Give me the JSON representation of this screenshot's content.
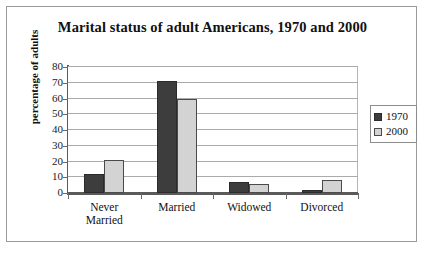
{
  "chart_data": {
    "type": "bar",
    "title": "Marital status of adult Americans, 1970 and 2000",
    "xlabel": "",
    "ylabel": "percentage of adults",
    "categories": [
      "Never\nMarried",
      "Married",
      "Widowed",
      "Divorced"
    ],
    "series": [
      {
        "name": "1970",
        "values": [
          12,
          71,
          7,
          2
        ],
        "color": "#3d3d3d"
      },
      {
        "name": "2000",
        "values": [
          21,
          60,
          6,
          8
        ],
        "color": "#d3d3d3"
      }
    ],
    "ylim": [
      0,
      80
    ],
    "yticks": [
      0,
      10,
      20,
      30,
      40,
      50,
      60,
      70,
      80
    ],
    "ytick_labels": [
      "0",
      "10",
      "20",
      "30",
      "40",
      "50",
      "60",
      "70",
      "80"
    ],
    "grid": true,
    "legend_position": "right"
  },
  "legend": {
    "entries": [
      {
        "label": "1970",
        "swatch": "dark-square-swatch"
      },
      {
        "label": "2000",
        "swatch": "light-square-swatch"
      }
    ]
  }
}
